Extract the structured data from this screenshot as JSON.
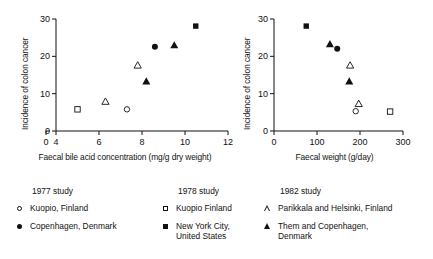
{
  "figure": {
    "background": "#ffffff",
    "ink": "#111111"
  },
  "chart_data": [
    {
      "id": "left",
      "type": "scatter",
      "title": "",
      "xlabel": "Faecal bile acid concentration (mg/g dry weight)",
      "ylabel": "Incidence of colon cancer",
      "xlim": [
        4,
        12
      ],
      "ylim": [
        0,
        30
      ],
      "xticks": [
        4,
        6,
        8,
        10,
        12
      ],
      "xtick_labels": [
        "4",
        "6",
        "8",
        "10",
        "12"
      ],
      "yticks": [
        0,
        10,
        20,
        30
      ],
      "ytick_labels": [
        "0",
        "10",
        "20",
        "30"
      ],
      "origin_label": "0",
      "axis_break": true,
      "grid": false,
      "legend_position": "below-figure",
      "series": [
        {
          "name": "Kuopio, Finland",
          "study": "1977 study",
          "marker": "circle-open",
          "points": [
            {
              "x": 7.3,
              "y": 5.8
            }
          ]
        },
        {
          "name": "Copenhagen, Denmark",
          "study": "1977 study",
          "marker": "circle-filled",
          "points": [
            {
              "x": 8.6,
              "y": 22.6
            }
          ]
        },
        {
          "name": "Kuopio Finland",
          "study": "1978 study",
          "marker": "square-open",
          "points": [
            {
              "x": 5.0,
              "y": 5.8
            }
          ]
        },
        {
          "name": "New York City, United States",
          "study": "1978 study",
          "marker": "square-filled",
          "points": [
            {
              "x": 10.5,
              "y": 28.1
            }
          ]
        },
        {
          "name": "Parikkala and Helsinki, Finland",
          "study": "1982 study",
          "marker": "triangle-open",
          "points": [
            {
              "x": 6.3,
              "y": 7.9
            },
            {
              "x": 7.8,
              "y": 17.6
            }
          ]
        },
        {
          "name": "Them and Copenhagen, Denmark",
          "study": "1982 study",
          "marker": "triangle-filled",
          "points": [
            {
              "x": 8.2,
              "y": 13.3
            },
            {
              "x": 9.5,
              "y": 23.0
            }
          ]
        }
      ]
    },
    {
      "id": "right",
      "type": "scatter",
      "title": "",
      "xlabel": "Faecal weight (g/day)",
      "ylabel": "Incidence of colon cancer",
      "xlim": [
        0,
        300
      ],
      "ylim": [
        0,
        30
      ],
      "xticks": [
        0,
        100,
        200,
        300
      ],
      "xtick_labels": [
        "0",
        "100",
        "200",
        "300"
      ],
      "yticks": [
        0,
        10,
        20,
        30
      ],
      "ytick_labels": [
        "0",
        "10",
        "20",
        "30"
      ],
      "origin_label": "0",
      "axis_break": false,
      "grid": false,
      "legend_position": "below-figure",
      "series": [
        {
          "name": "Kuopio, Finland",
          "study": "1977 study",
          "marker": "circle-open",
          "points": [
            {
              "x": 190,
              "y": 5.3
            }
          ]
        },
        {
          "name": "Copenhagen, Denmark",
          "study": "1977 study",
          "marker": "circle-filled",
          "points": [
            {
              "x": 147,
              "y": 22.0
            }
          ]
        },
        {
          "name": "Kuopio Finland",
          "study": "1978 study",
          "marker": "square-open",
          "points": [
            {
              "x": 270,
              "y": 5.2
            }
          ]
        },
        {
          "name": "New York City, United States",
          "study": "1978 study",
          "marker": "square-filled",
          "points": [
            {
              "x": 75,
              "y": 28.1
            }
          ]
        },
        {
          "name": "Parikkala and Helsinki, Finland",
          "study": "1982 study",
          "marker": "triangle-open",
          "points": [
            {
              "x": 197,
              "y": 7.3
            },
            {
              "x": 177,
              "y": 17.6
            }
          ]
        },
        {
          "name": "Them and Copenhagen, Denmark",
          "study": "1982 study",
          "marker": "triangle-filled",
          "points": [
            {
              "x": 130,
              "y": 23.3
            },
            {
              "x": 175,
              "y": 13.3
            }
          ]
        }
      ]
    }
  ],
  "legend": {
    "columns": [
      {
        "heading": "1977 study",
        "entries": [
          {
            "marker": "circle-open",
            "label": "Kuopio, Finland"
          },
          {
            "marker": "circle-filled",
            "label": "Copenhagen, Denmark"
          }
        ]
      },
      {
        "heading": "1978 study",
        "entries": [
          {
            "marker": "square-open",
            "label": "Kuopio Finland"
          },
          {
            "marker": "square-filled",
            "label": "New York City,\nUnited States"
          }
        ]
      },
      {
        "heading": "1982 study",
        "entries": [
          {
            "marker": "triangle-open",
            "label": "Parikkala and Helsinki, Finland"
          },
          {
            "marker": "triangle-filled",
            "label": "Them and Copenhagen,\nDenmark"
          }
        ]
      }
    ]
  }
}
